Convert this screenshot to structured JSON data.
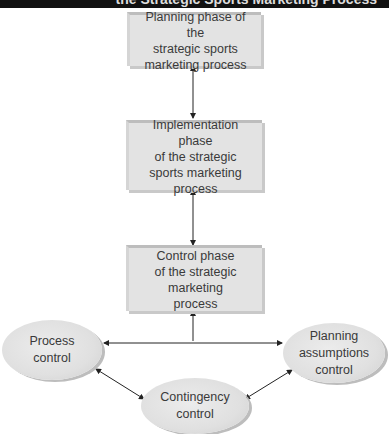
{
  "header": {
    "title": "the Strategic Sports Marketing Process"
  },
  "phases": [
    {
      "label": "Planning phase of the\nstrategic sports\nmarketing process"
    },
    {
      "label": "Implementation phase\nof the strategic\nsports marketing\nprocess"
    },
    {
      "label": "Control phase\nof the strategic\nmarketing\nprocess"
    }
  ],
  "controls": [
    {
      "label": "Process\ncontrol"
    },
    {
      "label": "Contingency\ncontrol"
    },
    {
      "label": "Planning\nassumptions\ncontrol"
    }
  ]
}
